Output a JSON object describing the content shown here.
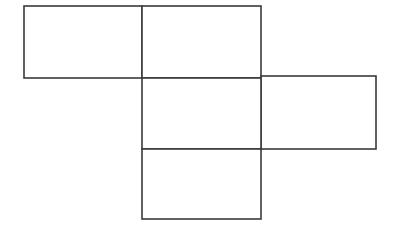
{
  "figure": {
    "type": "geometric-line-diagram",
    "canvas": {
      "width": 395,
      "height": 230,
      "background": "#ffffff"
    },
    "stroke": {
      "color": "#3a3a3a",
      "width": 1.6,
      "linejoin": "miter"
    },
    "faces": [
      {
        "name": "top-left-face",
        "label": "",
        "shape": "rectangle",
        "x": 24,
        "y": 6,
        "width": 118,
        "height": 72,
        "fill": "#ffffff"
      },
      {
        "name": "top-middle-face",
        "label": "",
        "shape": "rectangle",
        "x": 142,
        "y": 6,
        "width": 119,
        "height": 72,
        "fill": "#ffffff"
      },
      {
        "name": "center-face",
        "label": "",
        "shape": "rectangle",
        "x": 142,
        "y": 78,
        "width": 119,
        "height": 71,
        "fill": "#ffffff"
      },
      {
        "name": "right-face",
        "label": "",
        "shape": "rectangle",
        "x": 261,
        "y": 76,
        "width": 115,
        "height": 73,
        "fill": "#ffffff"
      },
      {
        "name": "bottom-face",
        "label": "",
        "shape": "rectangle",
        "x": 142,
        "y": 149,
        "width": 119,
        "height": 70,
        "fill": "#ffffff"
      }
    ],
    "face_count": 5
  }
}
